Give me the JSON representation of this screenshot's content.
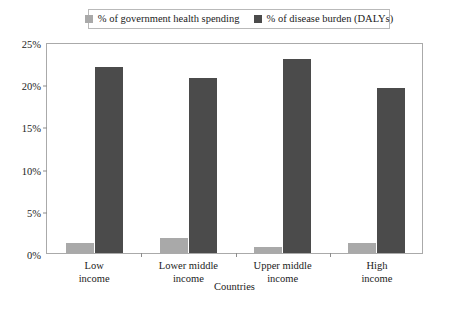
{
  "chart_data": {
    "type": "bar",
    "title": "",
    "subtitle": "",
    "xlabel": "Countries",
    "ylabel": "",
    "categories": [
      "Low income",
      "Lower middle income",
      "Upper middle income",
      "High income"
    ],
    "category_lines": [
      [
        "Low",
        "income"
      ],
      [
        "Lower middle",
        "income"
      ],
      [
        "Upper middle",
        "income"
      ],
      [
        "High",
        "income"
      ]
    ],
    "series": [
      {
        "name": "% of government health spending",
        "color": "#a9a9a9",
        "values": [
          1.2,
          1.8,
          0.7,
          1.2
        ]
      },
      {
        "name": "% of disease burden (DALYs)",
        "color": "#4b4b4b",
        "values": [
          22.0,
          20.7,
          23.0,
          19.5
        ]
      }
    ],
    "ylim": [
      0,
      25
    ],
    "ytick_values": [
      0,
      5,
      10,
      15,
      20,
      25
    ],
    "ytick_labels": [
      "0%",
      "5%",
      "10%",
      "15%",
      "20%",
      "25%"
    ],
    "grid": false,
    "legend_position": "top"
  },
  "axes": {
    "frame_color": "#aaaaaa",
    "tick_color": "#8c8c8c",
    "text_color": "#1b1b1b"
  },
  "legend": {
    "border_color": "#b9b9b9",
    "background": "#ffffff"
  }
}
